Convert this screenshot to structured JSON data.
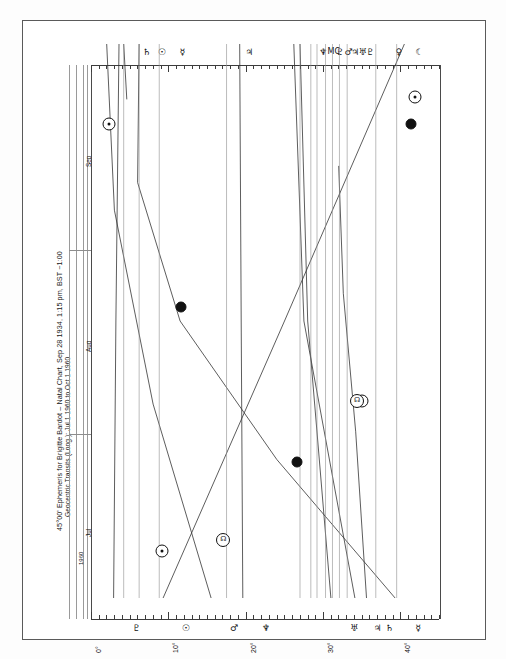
{
  "document": {
    "kind": "45-degree-ephemeris-scan",
    "title_line_1": "45°00' Ephemeris for Brigitte Bardot – Natal Chart, Sep 28 1934, 1:15 pm, BST −1:00",
    "title_line_2": "Geocentric Transits (Long.): Jul 1 1960 to Oct 1 1960",
    "subject_name": "Brigitte Bardot",
    "chart_type": "Natal Chart",
    "birth_date": "Sep 28 1934",
    "birth_time": "1:15 pm",
    "timezone": "BST −1:00",
    "dial_modulus": "45°00'",
    "coordinate_system": "Geocentric",
    "measure": "Transits (Long.)",
    "range_start": "Jul 1 1960",
    "range_end": "Oct 1 1960"
  },
  "time_axis": {
    "orientation": "vertical-bottom-to-top",
    "year_label": "1960",
    "months": [
      {
        "label": "Jul"
      },
      {
        "label": "Aug"
      },
      {
        "label": "Sep"
      }
    ]
  },
  "degree_axis": {
    "unit": "degrees",
    "min": 0,
    "max": 45,
    "major_labels": [
      "0°",
      "10°",
      "20°",
      "30°",
      "40°"
    ],
    "major_values": [
      0,
      10,
      20,
      30,
      40
    ],
    "minor_step": 1
  },
  "glyphs": {
    "sun": "☉",
    "moon": "☾",
    "mercury": "☿",
    "venus": "♀",
    "mars": "♂",
    "jupiter": "♃",
    "saturn": "♄",
    "uranus": "♅",
    "neptune": "♆",
    "pluto": "♇",
    "node": "☊",
    "ascendant": "Asc",
    "midheaven": "MC"
  },
  "natal_axis": {
    "position": "top",
    "points": [
      {
        "name": "saturn",
        "glyph": "♄",
        "degree": 7.2
      },
      {
        "name": "sun",
        "glyph": "☉",
        "degree": 9.2
      },
      {
        "name": "mercury",
        "glyph": "☿",
        "degree": 11.8
      },
      {
        "name": "jupiter",
        "glyph": "♃",
        "degree": 20.5
      },
      {
        "name": "neptune",
        "glyph": "♆",
        "degree": 30.0
      },
      {
        "name": "midheaven",
        "glyph": "MC",
        "degree": 31.4
      },
      {
        "name": "pluto",
        "glyph": "♇",
        "degree": 32.2
      },
      {
        "name": "mars",
        "glyph": "♂",
        "degree": 33.3
      },
      {
        "name": "jupiter2",
        "glyph": "♃",
        "degree": 34.2
      },
      {
        "name": "uranus",
        "glyph": "♅",
        "degree": 35.1
      },
      {
        "name": "pluto2",
        "glyph": "♇",
        "degree": 36.1
      },
      {
        "name": "venus",
        "glyph": "♀",
        "degree": 39.8
      },
      {
        "name": "moon",
        "glyph": "☾",
        "degree": 42.5
      }
    ]
  },
  "transit_axis": {
    "position": "bottom",
    "points": [
      {
        "name": "pluto",
        "glyph": "♇",
        "degree": 5.9
      },
      {
        "name": "moon",
        "glyph": "☉",
        "degree": 12.3
      },
      {
        "name": "mars",
        "glyph": "♂",
        "degree": 18.5
      },
      {
        "name": "neptune",
        "glyph": "♆",
        "degree": 22.6
      },
      {
        "name": "uranus",
        "glyph": "♅",
        "degree": 34.0
      },
      {
        "name": "jupiter",
        "glyph": "♃",
        "degree": 37.1
      },
      {
        "name": "saturn",
        "glyph": "♄",
        "degree": 38.6
      },
      {
        "name": "mercury",
        "glyph": "☿",
        "degree": 42.3
      }
    ]
  },
  "chart_data": {
    "type": "line",
    "title": "45°00' Ephemeris for Brigitte Bardot – Natal Chart, Sep 28 1934, 1:15 pm, BST −1:00",
    "subtitle": "Geocentric Transits (Long.): Jul 1 1960 to Oct 1 1960",
    "xlabel": "45° dial longitude",
    "ylabel": "Date (Jul 1 1960 – Oct 1 1960)",
    "xlim": [
      0,
      45
    ],
    "ylim": [
      "1960-07-01",
      "1960-10-01"
    ],
    "grid": true,
    "legend": "none",
    "orientation": "time-vertical",
    "x_tick_labels": [
      "0°",
      "10°",
      "20°",
      "30°",
      "40°"
    ],
    "x_tick_values": [
      0,
      10,
      20,
      30,
      40
    ],
    "y_tick_labels": [
      "Jul",
      "Aug",
      "Sep"
    ],
    "series": [
      {
        "name": "Saturn",
        "glyph": "♄",
        "color": "#333333",
        "points": [
          {
            "t": 0.0,
            "x": 38.6
          },
          {
            "t": 0.3,
            "x": 37.2
          },
          {
            "t": 0.55,
            "x": 35.6
          },
          {
            "t": 0.78,
            "x": 35.0
          },
          {
            "t": 0.9,
            "x": 7.6
          },
          {
            "t": 1.0,
            "x": 7.2
          }
        ]
      },
      {
        "name": "Mercury",
        "glyph": "☿",
        "color": "#333333",
        "points": [
          {
            "t": 0.0,
            "x": 42.3
          },
          {
            "t": 0.25,
            "x": 27.0
          },
          {
            "t": 0.5,
            "x": 14.5
          },
          {
            "t": 0.75,
            "x": 9.0
          },
          {
            "t": 1.0,
            "x": 9.2
          }
        ]
      },
      {
        "name": "Mars",
        "glyph": "♂",
        "color": "#333333",
        "points": [
          {
            "t": 0.0,
            "x": 18.5
          },
          {
            "t": 0.35,
            "x": 11.0
          },
          {
            "t": 0.7,
            "x": 6.0
          },
          {
            "t": 1.0,
            "x": 5.0
          }
        ]
      },
      {
        "name": "Jupiter",
        "glyph": "♃",
        "color": "#333333",
        "points": [
          {
            "t": 0.0,
            "x": 37.1
          },
          {
            "t": 0.5,
            "x": 30.5
          },
          {
            "t": 1.0,
            "x": 29.2
          }
        ]
      },
      {
        "name": "Uranus",
        "glyph": "♅",
        "color": "#333333",
        "points": [
          {
            "t": 0.0,
            "x": 34.0
          },
          {
            "t": 0.5,
            "x": 31.0
          },
          {
            "t": 1.0,
            "x": 30.0
          }
        ]
      },
      {
        "name": "Neptune",
        "glyph": "♆",
        "color": "#333333",
        "points": [
          {
            "t": 0.0,
            "x": 22.6
          },
          {
            "t": 0.5,
            "x": 22.4
          },
          {
            "t": 1.0,
            "x": 22.2
          }
        ]
      },
      {
        "name": "Pluto",
        "glyph": "♇",
        "color": "#333333",
        "points": [
          {
            "t": 0.0,
            "x": 5.9
          },
          {
            "t": 0.5,
            "x": 6.2
          },
          {
            "t": 1.0,
            "x": 6.6
          }
        ]
      },
      {
        "name": "Moon-Node",
        "glyph": "☊",
        "color": "#333333",
        "points": [
          {
            "t": 0.0,
            "x": 12.3
          },
          {
            "t": 0.5,
            "x": 28.0
          },
          {
            "t": 1.0,
            "x": 43.5
          }
        ]
      }
    ],
    "aspect_markers": [
      {
        "label": "conjunction",
        "x": 14.6,
        "t": 0.525,
        "style": "filled-dot"
      },
      {
        "label": "conjunction",
        "x": 29.6,
        "t": 0.245,
        "style": "filled-dot"
      },
      {
        "label": "conjunction",
        "x": 44.4,
        "t": 0.855,
        "style": "filled-dot"
      },
      {
        "label": "moon-marker",
        "x": 12.1,
        "t": 0.085,
        "style": "sun-dot"
      },
      {
        "label": "moon-marker",
        "x": 5.3,
        "t": 0.855,
        "style": "sun-dot"
      },
      {
        "label": "moon-marker",
        "x": 44.9,
        "t": 0.905,
        "style": "sun-dot"
      },
      {
        "label": "moon-marker",
        "x": 38.0,
        "t": 0.355,
        "style": "sun-dot"
      },
      {
        "label": "node-ring",
        "x": 20.1,
        "t": 0.105,
        "style": "ring",
        "glyph": "☊"
      },
      {
        "label": "node-ring",
        "x": 37.4,
        "t": 0.355,
        "style": "ring",
        "glyph": "☊"
      }
    ]
  }
}
